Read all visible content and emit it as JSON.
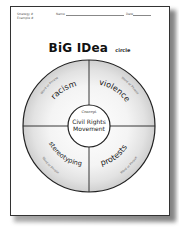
{
  "worksheet": {
    "header": {
      "strategy_label": "Strategy #",
      "example_label": "Example #",
      "name_label": "Name",
      "date_label": "Date"
    },
    "title": {
      "main": "BiG IDea",
      "sub": "circle"
    },
    "center": {
      "caption": "Concept",
      "line1": "Civil Rights",
      "line2": "Movement"
    },
    "quadrants": [
      {
        "position": "top-left",
        "word": "racism",
        "caption": "Word or Phrase"
      },
      {
        "position": "top-right",
        "word": "violence",
        "caption": "Word or Phrase"
      },
      {
        "position": "bottom-left",
        "word": "stereotyping",
        "caption": "Word or Phrase"
      },
      {
        "position": "bottom-right",
        "word": "protests",
        "caption": "Word or Phrase"
      }
    ]
  }
}
